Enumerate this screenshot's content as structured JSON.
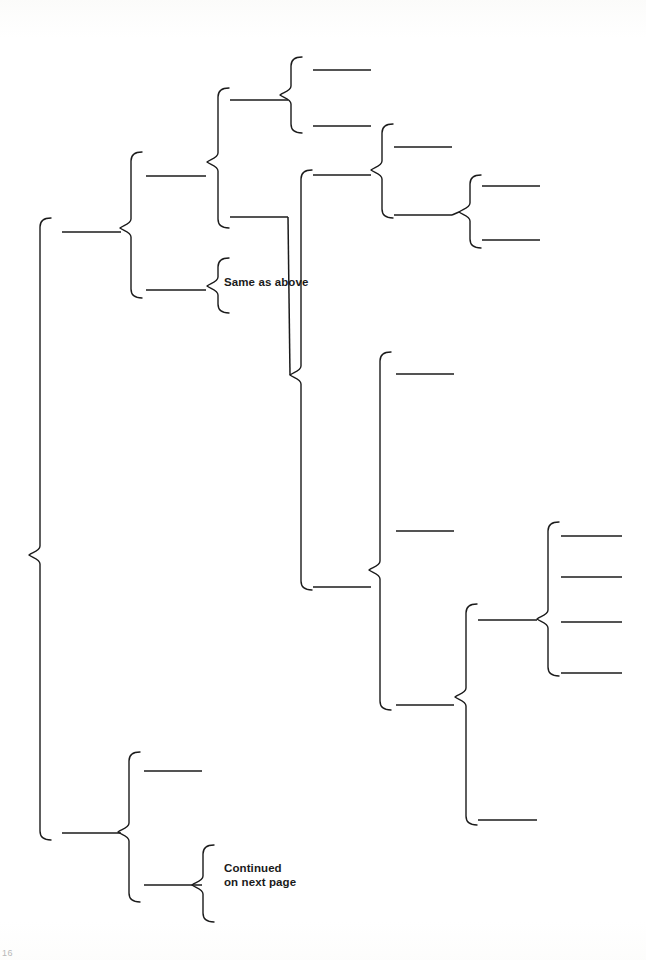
{
  "page": {
    "width": 646,
    "height": 960,
    "background_color": "#ffffff",
    "ink_color": "#1b1b1b",
    "folio_label": "16"
  },
  "diagram": {
    "type": "hierarchical-brace-diagram",
    "stroke_color": "#1b1b1b",
    "stroke_width": 1.4,
    "labels": [
      {
        "id": "same-as-above",
        "text": "Same as above",
        "x": 224,
        "y": 275,
        "lines": 1
      },
      {
        "id": "continued-on-next-page",
        "text": "Continued\non next page",
        "x": 224,
        "y": 861,
        "lines": 2
      }
    ],
    "braces": [
      {
        "id": "brace-root",
        "x": 40,
        "top": 218,
        "bottom": 840,
        "tip": 555,
        "depth": 0
      },
      {
        "id": "brace-l1-upper",
        "x": 131,
        "top": 152,
        "bottom": 298,
        "tip": 228,
        "depth": 1
      },
      {
        "id": "brace-l1-lower",
        "x": 129,
        "top": 752,
        "bottom": 902,
        "tip": 832,
        "depth": 1
      },
      {
        "id": "brace-l2-a",
        "x": 218,
        "top": 88,
        "bottom": 228,
        "tip": 162,
        "depth": 2
      },
      {
        "id": "brace-l2-b",
        "x": 218,
        "top": 258,
        "bottom": 313,
        "tip": 286,
        "depth": 2
      },
      {
        "id": "brace-l2-c",
        "x": 203,
        "top": 845,
        "bottom": 922,
        "tip": 885,
        "depth": 2
      },
      {
        "id": "brace-l3-a",
        "x": 291,
        "top": 57,
        "bottom": 133,
        "tip": 95,
        "depth": 3
      },
      {
        "id": "brace-l3-b",
        "x": 301,
        "top": 170,
        "bottom": 590,
        "tip": 375,
        "depth": 3
      },
      {
        "id": "brace-l4-a",
        "x": 382,
        "top": 124,
        "bottom": 218,
        "tip": 170,
        "depth": 4
      },
      {
        "id": "brace-l4-b",
        "x": 380,
        "top": 352,
        "bottom": 710,
        "tip": 570,
        "depth": 4
      },
      {
        "id": "brace-l5-a",
        "x": 470,
        "top": 175,
        "bottom": 248,
        "tip": 212,
        "depth": 5
      },
      {
        "id": "brace-l5-b",
        "x": 466,
        "top": 604,
        "bottom": 825,
        "tip": 697,
        "depth": 5
      },
      {
        "id": "brace-l6",
        "x": 548,
        "top": 522,
        "bottom": 676,
        "tip": 619,
        "depth": 6
      }
    ],
    "entry_rules": [
      {
        "id": "rule-root-1",
        "parent": "brace-root",
        "x1": 62,
        "x2": 121,
        "y": 232
      },
      {
        "id": "rule-root-2",
        "parent": "brace-root",
        "x1": 62,
        "x2": 121,
        "y": 833
      },
      {
        "id": "rule-l1u-1",
        "parent": "brace-l1-upper",
        "x1": 146,
        "x2": 206,
        "y": 176
      },
      {
        "id": "rule-l1u-2",
        "parent": "brace-l1-upper",
        "x1": 146,
        "x2": 206,
        "y": 290
      },
      {
        "id": "rule-l1l-1",
        "parent": "brace-l1-lower",
        "x1": 144,
        "x2": 202,
        "y": 771
      },
      {
        "id": "rule-l1l-2",
        "parent": "brace-l1-lower",
        "x1": 144,
        "x2": 202,
        "y": 885
      },
      {
        "id": "rule-l2a-1",
        "parent": "brace-l2-a",
        "x1": 230,
        "x2": 288,
        "y": 100
      },
      {
        "id": "rule-l2a-2",
        "parent": "brace-l2-a",
        "x1": 230,
        "x2": 288,
        "y": 217
      },
      {
        "id": "rule-l3a-1",
        "parent": "brace-l3-a",
        "x1": 313,
        "x2": 371,
        "y": 70
      },
      {
        "id": "rule-l3a-2",
        "parent": "brace-l3-a",
        "x1": 313,
        "x2": 371,
        "y": 126
      },
      {
        "id": "rule-l3b-1",
        "parent": "brace-l3-b",
        "x1": 313,
        "x2": 371,
        "y": 175
      },
      {
        "id": "rule-l3b-2",
        "parent": "brace-l3-b",
        "x1": 313,
        "x2": 371,
        "y": 587
      },
      {
        "id": "rule-l4a-1",
        "parent": "brace-l4-a",
        "x1": 394,
        "x2": 452,
        "y": 147
      },
      {
        "id": "rule-l4a-2",
        "parent": "brace-l4-a",
        "x1": 394,
        "x2": 452,
        "y": 215
      },
      {
        "id": "rule-l4b-1",
        "parent": "brace-l4-b",
        "x1": 396,
        "x2": 454,
        "y": 374
      },
      {
        "id": "rule-l4b-2",
        "parent": "brace-l4-b",
        "x1": 396,
        "x2": 454,
        "y": 531
      },
      {
        "id": "rule-l4b-3",
        "parent": "brace-l4-b",
        "x1": 396,
        "x2": 454,
        "y": 705
      },
      {
        "id": "rule-l5a-1",
        "parent": "brace-l5-a",
        "x1": 482,
        "x2": 540,
        "y": 186
      },
      {
        "id": "rule-l5a-2",
        "parent": "brace-l5-a",
        "x1": 482,
        "x2": 540,
        "y": 240
      },
      {
        "id": "rule-l5b-1",
        "parent": "brace-l5-b",
        "x1": 478,
        "x2": 537,
        "y": 620
      },
      {
        "id": "rule-l5b-2",
        "parent": "brace-l5-b",
        "x1": 478,
        "x2": 537,
        "y": 820
      },
      {
        "id": "rule-l6-1",
        "parent": "brace-l6",
        "x1": 561,
        "x2": 622,
        "y": 536
      },
      {
        "id": "rule-l6-2",
        "parent": "brace-l6",
        "x1": 561,
        "x2": 622,
        "y": 577
      },
      {
        "id": "rule-l6-3",
        "parent": "brace-l6",
        "x1": 561,
        "x2": 622,
        "y": 622
      },
      {
        "id": "rule-l6-4",
        "parent": "brace-l6",
        "x1": 561,
        "x2": 622,
        "y": 673
      }
    ],
    "connectors": [
      {
        "id": "conn-root-to-l1u",
        "from": "rule-root-1",
        "to": "brace-l1-upper"
      },
      {
        "id": "conn-root-to-l1l",
        "from": "rule-root-2",
        "to": "brace-l1-lower"
      },
      {
        "id": "conn-l1u-to-l2a",
        "from": "rule-l1u-1",
        "to": "brace-l2-a"
      },
      {
        "id": "conn-l1u-to-l2b",
        "from": "rule-l1u-2",
        "to": "brace-l2-b"
      },
      {
        "id": "conn-l1l-to-l2c",
        "from": "rule-l1l-2",
        "to": "brace-l2-c"
      },
      {
        "id": "conn-l2a-to-l3a",
        "from": "rule-l2a-1",
        "to": "brace-l3-a"
      },
      {
        "id": "conn-l2a-to-l3b",
        "from": "rule-l2a-2",
        "to": "brace-l3-b"
      },
      {
        "id": "conn-l3a-to-l4a",
        "from": "rule-l3a-2",
        "to": "brace-l4-a"
      },
      {
        "id": "conn-l3b-to-l4b",
        "from": "rule-l3b-2",
        "to": "brace-l4-b"
      },
      {
        "id": "conn-l4a-to-l5a",
        "from": "rule-l4a-2",
        "to": "brace-l5-a"
      },
      {
        "id": "conn-l4b-to-l5b",
        "from": "rule-l4b-3",
        "to": "brace-l5-b"
      },
      {
        "id": "conn-l5b-to-l6",
        "from": "rule-l5b-1",
        "to": "brace-l6"
      }
    ]
  }
}
